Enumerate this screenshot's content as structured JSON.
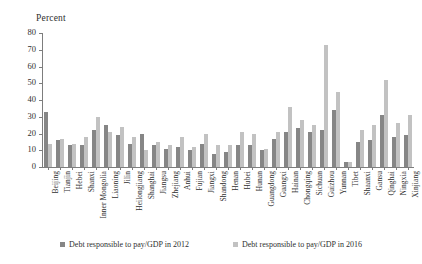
{
  "chart_data": {
    "type": "bar",
    "title": "",
    "ylabel": "Percent",
    "xlabel": "",
    "ylim": [
      0,
      80
    ],
    "yticks": [
      0,
      10,
      20,
      30,
      40,
      50,
      60,
      70,
      80
    ],
    "grid": false,
    "legend_position": "bottom",
    "categories": [
      "Beijing",
      "Tianjin",
      "Hebei",
      "Shanxi",
      "Inner Mongolia",
      "Liaoning",
      "Jilin",
      "Heilongjiang",
      "Shanghai",
      "Jiangsu",
      "Zhejiang",
      "Anhui",
      "Fujian",
      "Jiangxi",
      "Shandong",
      "Henan",
      "Hubei",
      "Hunan",
      "Guangdong",
      "Guangxi",
      "Hainan",
      "Chongqing",
      "Sichuan",
      "Guizhou",
      "Yunnan",
      "Tibet",
      "Shaanxi",
      "Gansu",
      "Qinghai",
      "Ningxia",
      "Xinjiang"
    ],
    "series": [
      {
        "name": "Debt responsible to pay/GDP in 2012",
        "color": "#868686",
        "values": [
          33,
          16,
          13,
          13,
          22,
          25,
          19,
          14,
          20,
          13,
          11,
          12,
          10,
          14,
          8,
          9,
          13,
          13,
          10,
          17,
          21,
          23,
          21,
          22,
          34,
          3,
          15,
          16,
          31,
          18,
          19
        ]
      },
      {
        "name": "Debt responsible to pay/GDP in 2016",
        "color": "#c2c2c2",
        "values": [
          14,
          17,
          14,
          18,
          30,
          21,
          24,
          18,
          10,
          15,
          13,
          18,
          12,
          20,
          13,
          13,
          21,
          20,
          11,
          21,
          36,
          28,
          25,
          73,
          45,
          3,
          22,
          25,
          52,
          26,
          31
        ]
      }
    ]
  },
  "legend": {
    "entries": [
      {
        "label": "Debt responsible to pay/GDP in 2012",
        "swatch_color": "#868686"
      },
      {
        "label": "Debt responsible to pay/GDP in 2016",
        "swatch_color": "#c2c2c2"
      }
    ]
  }
}
